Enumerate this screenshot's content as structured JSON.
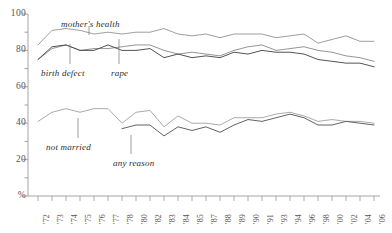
{
  "chart_data": {
    "type": "line",
    "title": "",
    "subtitle": "",
    "xlabel": "",
    "ylabel": "%",
    "ylim": [
      0,
      100
    ],
    "yticks": [
      0,
      20,
      40,
      60,
      80,
      100
    ],
    "ytick_labels": [
      "%",
      "20",
      "40",
      "60",
      "80",
      "100"
    ],
    "yminor_step": 10,
    "grid": false,
    "legend": "inline-labels",
    "x": [
      "'72",
      "'73",
      "'74",
      "'75",
      "'76",
      "'77",
      "'78",
      "'80",
      "'82",
      "'83",
      "'84",
      "'85",
      "'87",
      "'88",
      "'89",
      "'90",
      "'91",
      "'93",
      "'94",
      "'96",
      "'98",
      "'00",
      "'02",
      "'04",
      "'06"
    ],
    "series": [
      {
        "name": "mother's health",
        "color": "#9a9a9a",
        "values": [
          83,
          91,
          92,
          91,
          89,
          90,
          89,
          90,
          90,
          92,
          89,
          88,
          89,
          87,
          89,
          89,
          89,
          87,
          88,
          89,
          84,
          86,
          88,
          85,
          85
        ]
      },
      {
        "name": "rape",
        "color": "#8f8f8f",
        "values": [
          75,
          81,
          83,
          80,
          81,
          81,
          82,
          83,
          83,
          80,
          78,
          79,
          78,
          77,
          80,
          82,
          83,
          80,
          81,
          82,
          80,
          79,
          77,
          76,
          74
        ]
      },
      {
        "name": "birth defect",
        "color": "#4a4a4a",
        "values": [
          75,
          82,
          83,
          80,
          80,
          83,
          80,
          80,
          81,
          76,
          78,
          76,
          77,
          76,
          79,
          78,
          80,
          79,
          79,
          78,
          75,
          74,
          73,
          73,
          71
        ]
      },
      {
        "name": "not married",
        "color": "#a5a5a5",
        "values": [
          41,
          46,
          48,
          46,
          48,
          48,
          40,
          46,
          47,
          38,
          44,
          40,
          40,
          39,
          43,
          43,
          43,
          45,
          46,
          44,
          41,
          42,
          41,
          41,
          40
        ]
      },
      {
        "name": "any reason",
        "color": "#5a5a5a",
        "values": [
          null,
          null,
          null,
          null,
          null,
          null,
          37,
          39,
          39,
          33,
          38,
          36,
          38,
          35,
          39,
          42,
          41,
          43,
          45,
          43,
          39,
          39,
          41,
          40,
          39
        ]
      }
    ],
    "annotations": [
      {
        "name": "mother's health",
        "label_x": 61,
        "label_y": 19,
        "leader_x": 89,
        "leader_y1": 26,
        "leader_y2": 35
      },
      {
        "name": "birth defect",
        "label_x": 41,
        "label_y": 68,
        "leader_x": 70,
        "leader_y1": 64,
        "leader_y2": 44
      },
      {
        "name": "rape",
        "label_x": 111,
        "label_y": 68,
        "leader_x": 119,
        "leader_y1": 64,
        "leader_y2": 39
      },
      {
        "name": "not married",
        "label_x": 46,
        "label_y": 142,
        "leader_x": 78,
        "leader_y1": 138,
        "leader_y2": 118
      },
      {
        "name": "any reason",
        "label_x": 113,
        "label_y": 158,
        "leader_x": 131,
        "leader_y1": 154,
        "leader_y2": 135
      }
    ]
  },
  "axis": {
    "y_labels": [
      "100",
      "80",
      "60",
      "40",
      "20",
      "%"
    ],
    "x_labels": [
      "'72",
      "'73",
      "'74",
      "'75",
      "'76",
      "'77",
      "'78",
      "'80",
      "'82",
      "'83",
      "'84",
      "'85",
      "'87",
      "'88",
      "'89",
      "'90",
      "'91",
      "'93",
      "'94",
      "'96",
      "'98",
      "'00",
      "'02",
      "'04",
      "'06"
    ]
  },
  "colors": {
    "axis": "#9b9b9b",
    "text": "#3a3a3a",
    "dark_line": "#4a4a4a",
    "light_line": "#a5a5a5",
    "background": "#ffffff"
  }
}
